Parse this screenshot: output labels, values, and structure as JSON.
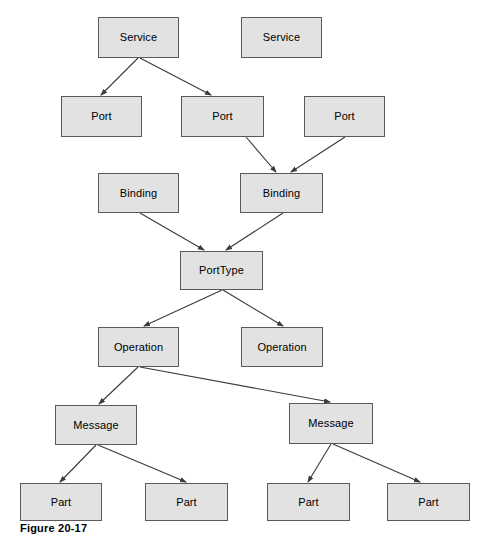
{
  "figure": {
    "caption": "Figure 20-17",
    "width": 487,
    "height": 552,
    "background_color": "#ffffff",
    "node_fill_color": "#e2e2e2",
    "node_border_color": "#5a5a5a",
    "edge_color": "#3a3a3a"
  },
  "nodes": [
    {
      "id": "service-1",
      "label": "Service",
      "x": 98,
      "y": 17,
      "w": 81,
      "h": 41
    },
    {
      "id": "service-2",
      "label": "Service",
      "x": 241,
      "y": 17,
      "w": 81,
      "h": 41
    },
    {
      "id": "port-1",
      "label": "Port",
      "x": 61,
      "y": 96,
      "w": 81,
      "h": 41
    },
    {
      "id": "port-2",
      "label": "Port",
      "x": 181,
      "y": 96,
      "w": 83,
      "h": 41
    },
    {
      "id": "port-3",
      "label": "Port",
      "x": 304,
      "y": 96,
      "w": 81,
      "h": 41
    },
    {
      "id": "binding-1",
      "label": "Binding",
      "x": 98,
      "y": 173,
      "w": 81,
      "h": 40
    },
    {
      "id": "binding-2",
      "label": "Binding",
      "x": 240,
      "y": 173,
      "w": 83,
      "h": 40
    },
    {
      "id": "porttype-1",
      "label": "PortType",
      "x": 180,
      "y": 251,
      "w": 83,
      "h": 39
    },
    {
      "id": "operation-1",
      "label": "Operation",
      "x": 98,
      "y": 327,
      "w": 81,
      "h": 40
    },
    {
      "id": "operation-2",
      "label": "Operation",
      "x": 241,
      "y": 327,
      "w": 82,
      "h": 40
    },
    {
      "id": "message-1",
      "label": "Message",
      "x": 55,
      "y": 405,
      "w": 82,
      "h": 40
    },
    {
      "id": "message-2",
      "label": "Message",
      "x": 289,
      "y": 403,
      "w": 84,
      "h": 41
    },
    {
      "id": "part-1",
      "label": "Part",
      "x": 20,
      "y": 483,
      "w": 82,
      "h": 38
    },
    {
      "id": "part-2",
      "label": "Part",
      "x": 145,
      "y": 483,
      "w": 83,
      "h": 38
    },
    {
      "id": "part-3",
      "label": "Part",
      "x": 267,
      "y": 483,
      "w": 83,
      "h": 38
    },
    {
      "id": "part-4",
      "label": "Part",
      "x": 387,
      "y": 483,
      "w": 83,
      "h": 38
    }
  ],
  "edges": [
    {
      "id": "edge-service1-port1",
      "from": "service-1",
      "to": "port-1",
      "x1": 138,
      "y1": 58,
      "x2": 101,
      "y2": 95
    },
    {
      "id": "edge-service1-port2",
      "from": "service-1",
      "to": "port-2",
      "x1": 140,
      "y1": 58,
      "x2": 211,
      "y2": 95
    },
    {
      "id": "edge-port2-binding2",
      "from": "port-2",
      "to": "binding-2",
      "x1": 246,
      "y1": 137,
      "x2": 276,
      "y2": 172
    },
    {
      "id": "edge-port3-binding2",
      "from": "port-3",
      "to": "binding-2",
      "x1": 345,
      "y1": 137,
      "x2": 291,
      "y2": 172
    },
    {
      "id": "edge-binding1-porttype",
      "from": "binding-1",
      "to": "porttype-1",
      "x1": 140,
      "y1": 213,
      "x2": 204,
      "y2": 250
    },
    {
      "id": "edge-binding2-porttype",
      "from": "binding-2",
      "to": "porttype-1",
      "x1": 283,
      "y1": 213,
      "x2": 226,
      "y2": 250
    },
    {
      "id": "edge-porttype-operation1",
      "from": "porttype-1",
      "to": "operation-1",
      "x1": 222,
      "y1": 290,
      "x2": 144,
      "y2": 326
    },
    {
      "id": "edge-porttype-operation2",
      "from": "porttype-1",
      "to": "operation-2",
      "x1": 223,
      "y1": 290,
      "x2": 283,
      "y2": 326
    },
    {
      "id": "edge-operation1-message1",
      "from": "operation-1",
      "to": "message-1",
      "x1": 138,
      "y1": 367,
      "x2": 99,
      "y2": 404
    },
    {
      "id": "edge-operation1-message2",
      "from": "operation-1",
      "to": "message-2",
      "x1": 140,
      "y1": 367,
      "x2": 330,
      "y2": 402
    },
    {
      "id": "edge-message1-part1",
      "from": "message-1",
      "to": "part-1",
      "x1": 96,
      "y1": 445,
      "x2": 60,
      "y2": 482
    },
    {
      "id": "edge-message1-part2",
      "from": "message-1",
      "to": "part-2",
      "x1": 98,
      "y1": 445,
      "x2": 186,
      "y2": 482
    },
    {
      "id": "edge-message2-part3",
      "from": "message-2",
      "to": "part-3",
      "x1": 331,
      "y1": 444,
      "x2": 308,
      "y2": 482
    },
    {
      "id": "edge-message2-part4",
      "from": "message-2",
      "to": "part-4",
      "x1": 333,
      "y1": 444,
      "x2": 420,
      "y2": 482
    }
  ]
}
